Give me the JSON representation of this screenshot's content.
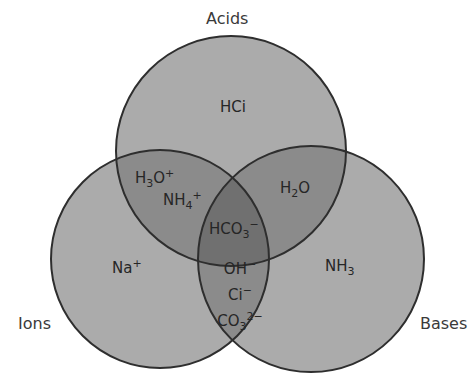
{
  "diagram": {
    "type": "venn3",
    "sets": [
      {
        "id": "acids",
        "label": "Acids"
      },
      {
        "id": "ions",
        "label": "Ions"
      },
      {
        "id": "bases",
        "label": "Bases"
      }
    ],
    "regions": {
      "acids_only": [
        "HCi"
      ],
      "ions_only": [
        "Na+"
      ],
      "bases_only": [
        "NH3"
      ],
      "acids_ions": [
        "H3O+",
        "NH4+"
      ],
      "acids_bases": [
        "H2O"
      ],
      "ions_bases": [
        "OH−",
        "Ci−",
        "CO3 2−"
      ],
      "all_three": [
        "HCO3−"
      ]
    },
    "colors": {
      "single": "#a9a9a9",
      "double": "#8a8a8a",
      "triple": "#6f6f6f",
      "outline": "#2e2e2e"
    }
  },
  "labels": {
    "acids": "Acids",
    "ions": "Ions",
    "bases": "Bases",
    "hci": "HCi",
    "na": "Na",
    "na_sup": "+",
    "nh3_main": "NH",
    "nh3_sub": "3",
    "h3o_h": "H",
    "h3o_sub": "3",
    "h3o_o": "O",
    "h3o_sup": "+",
    "nh4_main": "NH",
    "nh4_sub": "4",
    "nh4_sup": "+",
    "h2o_h": "H",
    "h2o_sub": "2",
    "h2o_o": "O",
    "hco3_main": "HCO",
    "hco3_sub": "3",
    "hco3_sup": "−",
    "oh_main": "OH",
    "oh_sup": "−",
    "ci_main": "Ci",
    "ci_sup": "−",
    "co3_main": "CO",
    "co3_sub": "3",
    "co3_sup": "2−"
  }
}
